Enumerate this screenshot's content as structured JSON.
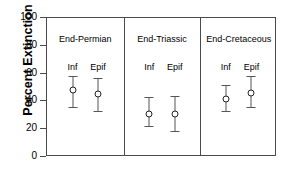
{
  "chart_data": {
    "type": "scatter",
    "title": "",
    "xlabel": "",
    "ylabel": "Percent Extinction",
    "ylim": [
      0,
      100
    ],
    "yticks": [
      0,
      20,
      40,
      60,
      80,
      100
    ],
    "ytick_labels": [
      "0",
      "20",
      "40",
      "60",
      "80",
      "100"
    ],
    "grid": false,
    "legend": "none",
    "panels": [
      {
        "name": "End-Permian",
        "points": [
          {
            "label": "Inf",
            "value": 48,
            "lower": 36,
            "upper": 58
          },
          {
            "label": "Epif",
            "value": 45,
            "lower": 33,
            "upper": 57
          }
        ]
      },
      {
        "name": "End-Triassic",
        "points": [
          {
            "label": "Inf",
            "value": 31,
            "lower": 22,
            "upper": 43
          },
          {
            "label": "Epif",
            "value": 31,
            "lower": 19,
            "upper": 44
          }
        ]
      },
      {
        "name": "End-Cretaceous",
        "points": [
          {
            "label": "Inf",
            "value": 42,
            "lower": 33,
            "upper": 52
          },
          {
            "label": "Epif",
            "value": 46,
            "lower": 36,
            "upper": 58
          }
        ]
      }
    ],
    "marker_style": "open-circle",
    "errorbar_style": "capped-vertical"
  },
  "colors": {
    "axis": "#4a4a4a",
    "errorbar": "#555555",
    "marker_edge": "#222222",
    "marker_fill": "#ffffff",
    "text": "#000000",
    "background": "#ffffff"
  }
}
